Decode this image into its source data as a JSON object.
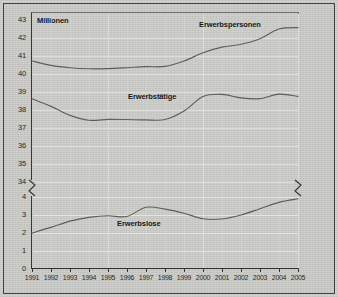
{
  "figure": {
    "unit_label": "Millionen",
    "background_color": "#cdcdc9",
    "line_color": "#5a5a57",
    "grid_color": "#e6e6e2",
    "frame_color": "#2e2e2c"
  },
  "axis_break": {
    "present": true,
    "side": "both",
    "between_values": [
      34,
      4
    ],
    "glyph": "zigzag"
  },
  "chart_data": {
    "type": "line",
    "title": "",
    "subtitle": "",
    "xlabel": "",
    "ylabel": "Millionen",
    "grid": true,
    "legend": "inline-labels",
    "x": [
      1991,
      1992,
      1993,
      1994,
      1995,
      1996,
      1997,
      1998,
      1999,
      2000,
      2001,
      2002,
      2003,
      2004,
      2005
    ],
    "xtick_labels": [
      "1991",
      "1992",
      "1993",
      "1994",
      "1995",
      "1996",
      "1997",
      "1998",
      "1999",
      "2000",
      "2001",
      "2002",
      "2003",
      "2004",
      "2005"
    ],
    "ytick_labels_upper": [
      "43",
      "42",
      "41",
      "40",
      "39",
      "38",
      "37",
      "36",
      "35",
      "34"
    ],
    "ytick_labels_lower": [
      "4",
      "3",
      "2",
      "1",
      "0"
    ],
    "ylim_upper": [
      34,
      43.4
    ],
    "ylim_lower": [
      0,
      4.4
    ],
    "broken_axis": true,
    "series": [
      {
        "name": "Erwerbspersonen",
        "label_x": 2000,
        "values": [
          40.72,
          40.48,
          40.35,
          40.29,
          40.3,
          40.35,
          40.41,
          40.42,
          40.72,
          41.18,
          41.49,
          41.65,
          41.96,
          42.5,
          42.58
        ]
      },
      {
        "name": "Erwerbstätige",
        "label_x": 1997,
        "values": [
          38.62,
          38.2,
          37.7,
          37.43,
          37.48,
          37.47,
          37.45,
          37.47,
          37.94,
          38.75,
          38.87,
          38.67,
          38.63,
          38.88,
          38.76
        ]
      },
      {
        "name": "Erwerbslose",
        "label_x": 1996,
        "values": [
          2.0,
          2.31,
          2.66,
          2.87,
          2.96,
          2.92,
          3.43,
          3.33,
          3.1,
          2.79,
          2.78,
          3.0,
          3.35,
          3.7,
          3.9
        ]
      }
    ]
  },
  "series_labels": [
    {
      "text": "Erwerbspersonen",
      "x": 199,
      "y": 20
    },
    {
      "text": "Erwerbstätige",
      "x": 128,
      "y": 92
    },
    {
      "text": "Erwerbslose",
      "x": 117,
      "y": 219
    }
  ]
}
